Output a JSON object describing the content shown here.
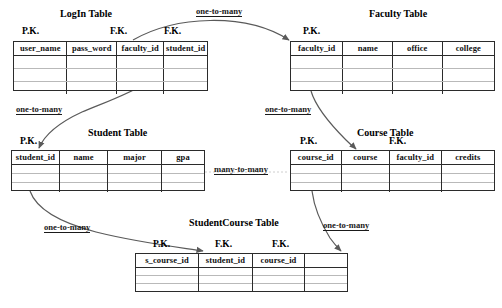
{
  "diagram": {
    "title_visible": false,
    "line_color": "#5a5a5a",
    "border_color": "#2b2b2b",
    "row_line_color": "#b9b9b9"
  },
  "tables": [
    {
      "id": "login",
      "title": "LogIn Table",
      "columns": [
        "user_name",
        "pass_word",
        "faculty_id",
        "student_id"
      ],
      "keys": [
        {
          "label": "P.K.",
          "column": "user_name"
        },
        {
          "label": "F.K.",
          "column": "faculty_id"
        },
        {
          "label": "F.K.",
          "column": "student_id"
        }
      ],
      "empty_rows": 3
    },
    {
      "id": "faculty",
      "title": "Faculty Table",
      "columns": [
        "faculty_id",
        "name",
        "office",
        "college"
      ],
      "keys": [
        {
          "label": "P.K.",
          "column": "faculty_id"
        }
      ],
      "empty_rows": 3
    },
    {
      "id": "student",
      "title": "Student Table",
      "columns": [
        "student_id",
        "name",
        "major",
        "gpa"
      ],
      "keys": [
        {
          "label": "P.K.",
          "column": "student_id"
        }
      ],
      "empty_rows": 3
    },
    {
      "id": "course",
      "title": "Course Table",
      "columns": [
        "course_id",
        "course",
        "faculty_id",
        "credits"
      ],
      "keys": [
        {
          "label": "P.K.",
          "column": "course_id"
        },
        {
          "label": "F.K.",
          "column": "faculty_id"
        }
      ],
      "empty_rows": 3
    },
    {
      "id": "studentcourse",
      "title": "StudentCourse Table",
      "columns": [
        "s_course_id",
        "student_id",
        "course_id",
        ""
      ],
      "keys": [
        {
          "label": "P.K.",
          "column": "s_course_id"
        },
        {
          "label": "F.K.",
          "column": "student_id"
        },
        {
          "label": "F.K.",
          "column": "course_id"
        }
      ],
      "empty_rows": 3
    }
  ],
  "relationships": [
    {
      "id": "faculty-login",
      "label": "one-to-many",
      "from": "faculty.faculty_id",
      "to": "login.faculty_id"
    },
    {
      "id": "student-login",
      "label": "one-to-many",
      "from": "student.student_id",
      "to": "login.student_id"
    },
    {
      "id": "faculty-course",
      "label": "one-to-many",
      "from": "faculty.faculty_id",
      "to": "course.faculty_id"
    },
    {
      "id": "student-course-m2m",
      "label": "many-to-many",
      "from": "student",
      "to": "course"
    },
    {
      "id": "student-studentcourse",
      "label": "one-to-many",
      "from": "student.student_id",
      "to": "studentcourse.student_id"
    },
    {
      "id": "course-studentcourse",
      "label": "one-to-many",
      "from": "course.course_id",
      "to": "studentcourse.course_id"
    }
  ],
  "labels": {
    "login_title": "LogIn Table",
    "faculty_title": "Faculty Table",
    "student_title": "Student Table",
    "course_title": "Course Table",
    "studentcourse_title": "StudentCourse Table",
    "login_pk": "P.K.",
    "login_fk1": "F.K.",
    "login_fk2": "F.K.",
    "faculty_pk": "P.K.",
    "student_pk": "P.K.",
    "course_pk": "P.K.",
    "course_fk": "F.K.",
    "sc_pk": "P.K.",
    "sc_fk1": "F.K.",
    "sc_fk2": "F.K.",
    "login_c1": "user_name",
    "login_c2": "pass_word",
    "login_c3": "faculty_id",
    "login_c4": "student_id",
    "faculty_c1": "faculty_id",
    "faculty_c2": "name",
    "faculty_c3": "office",
    "faculty_c4": "college",
    "student_c1": "student_id",
    "student_c2": "name",
    "student_c3": "major",
    "student_c4": "gpa",
    "course_c1": "course_id",
    "course_c2": "course",
    "course_c3": "faculty_id",
    "course_c4": "credits",
    "sc_c1": "s_course_id",
    "sc_c2": "student_id",
    "sc_c3": "course_id",
    "sc_c4": "",
    "rel_top": "one-to-many",
    "rel_left": "one-to-many",
    "rel_mid_right": "one-to-many",
    "rel_m2m": "many-to-many",
    "rel_bottom_left": "one-to-many",
    "rel_bottom_right": "one-to-many"
  }
}
